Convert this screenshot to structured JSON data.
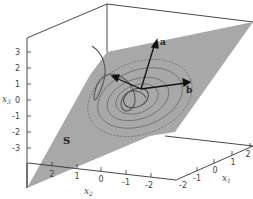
{
  "diagram": {
    "type": "3d-plot",
    "plane_label": "S",
    "vectors": [
      {
        "label": "a",
        "name": "vector-a"
      },
      {
        "label": "b",
        "name": "vector-b"
      }
    ],
    "axes": {
      "x1": {
        "label": "x",
        "subscript": "1",
        "ticks": [
          "-2",
          "-1",
          "0",
          "1",
          "2"
        ]
      },
      "x2": {
        "label": "x",
        "subscript": "2",
        "ticks": [
          "2",
          "1",
          "0",
          "-1",
          "-2"
        ]
      },
      "x3": {
        "label": "x",
        "subscript": "3",
        "ticks": [
          "3",
          "2",
          "1",
          "0",
          "-1",
          "-2",
          "-3"
        ]
      }
    },
    "colors": {
      "plane": "#a8a8a8",
      "lines": "#333333",
      "contours": "#6e6e6e"
    }
  }
}
